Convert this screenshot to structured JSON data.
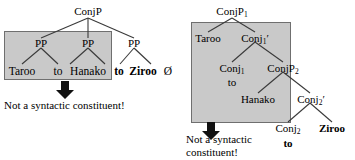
{
  "figure": {
    "shade_color": "#c9c9c9",
    "line_color": "#3a3a3a",
    "text_color": "#000000"
  },
  "left_tree": {
    "name": "flat-coordination-tree",
    "root": {
      "label": "ConjP"
    },
    "nodes": [
      {
        "id": "pp1",
        "label": "PP"
      },
      {
        "id": "pp2",
        "label": "PP"
      },
      {
        "id": "pp3",
        "label": "PP"
      }
    ],
    "leaves": [
      {
        "id": "l1",
        "text": "Taroo",
        "bold": false
      },
      {
        "id": "l2",
        "text": "to",
        "bold": false
      },
      {
        "id": "l3",
        "text": "Hanako",
        "bold": false
      },
      {
        "id": "l4",
        "text": "to",
        "bold": true
      },
      {
        "id": "l5",
        "text": "Ziroo",
        "bold": true
      },
      {
        "id": "l6",
        "text": "Ø",
        "bold": false
      }
    ],
    "annotation": "Not a syntactic constituent!",
    "highlight_note": "shaded region spans Taroo to Hanako"
  },
  "right_tree": {
    "name": "binary-branching-coordination-tree",
    "root": {
      "label": "ConjP",
      "sub": "1"
    },
    "nodes": [
      {
        "id": "taroo",
        "label": "Taroo",
        "sub": "",
        "prime": false
      },
      {
        "id": "conj1bar",
        "label": "Conj",
        "sub": "1",
        "prime": true
      },
      {
        "id": "conj1",
        "label": "Conj",
        "sub": "1",
        "prime": false
      },
      {
        "id": "conjp2",
        "label": "ConjP",
        "sub": "2",
        "prime": false
      },
      {
        "id": "hanako",
        "label": "Hanako",
        "sub": "",
        "prime": false
      },
      {
        "id": "conj2bar",
        "label": "Conj",
        "sub": "2",
        "prime": true
      },
      {
        "id": "conj2",
        "label": "Conj",
        "sub": "2",
        "prime": false
      },
      {
        "id": "ziroo",
        "label": "Ziroo",
        "sub": "",
        "prime": false
      }
    ],
    "leaves": [
      {
        "id": "r_to1",
        "text": "to",
        "bold": false
      },
      {
        "id": "r_to2",
        "text": "to",
        "bold": true
      },
      {
        "id": "r_ziroo",
        "text": "Ziroo",
        "bold": true
      }
    ],
    "annotation": "Not a syntactic\nconstituent!",
    "highlight_note": "shaded region spans Taroo, Conj1 to, Hanako"
  }
}
